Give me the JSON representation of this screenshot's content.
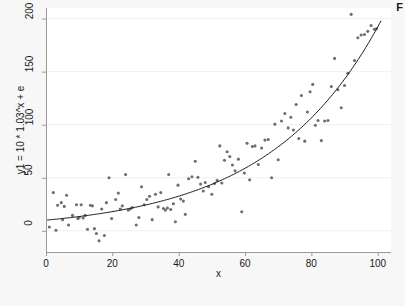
{
  "figure": {
    "corner_label": "F",
    "background_color": "#f7f7f7",
    "plot_background_color": "#ffffff"
  },
  "chart_data": {
    "type": "scatter",
    "title": "",
    "subtitle": "",
    "xlabel": "x",
    "ylabel": "y1 = 10 * 1.03^x + e",
    "xlim": [
      0,
      104
    ],
    "ylim": [
      -20,
      210
    ],
    "xticks": [
      0,
      20,
      40,
      60,
      80,
      100
    ],
    "yticks": [
      0,
      50,
      100,
      150,
      200
    ],
    "xtick_labels": [
      "0",
      "20",
      "40",
      "60",
      "80",
      "100"
    ],
    "ytick_labels": [
      "0",
      "50",
      "100",
      "150",
      "200"
    ],
    "grid": "horizontal-faint",
    "legend": "none",
    "marker_color": "#6e6e6e",
    "marker_size": 3.1,
    "line_color": "#1a1a1a",
    "line_width": 1.0,
    "fit": {
      "name": "exponential fit",
      "equation": "y = 10 * 1.03^x",
      "a": 10,
      "b": 1.03,
      "x_start": 0,
      "x_end": 101
    },
    "series": [
      {
        "name": "y1 observations",
        "points": [
          [
            1.0,
            3.5
          ],
          [
            2.2,
            36.0
          ],
          [
            3.0,
            0.5
          ],
          [
            3.5,
            24.0
          ],
          [
            4.6,
            26.5
          ],
          [
            5.0,
            10.5
          ],
          [
            5.5,
            23.0
          ],
          [
            6.2,
            33.5
          ],
          [
            6.8,
            5.5
          ],
          [
            8.0,
            14.5
          ],
          [
            9.2,
            24.5
          ],
          [
            9.6,
            11.5
          ],
          [
            10.0,
            12.5
          ],
          [
            10.6,
            24.5
          ],
          [
            11.2,
            12.0
          ],
          [
            11.8,
            14.5
          ],
          [
            12.5,
            1.5
          ],
          [
            13.4,
            24.0
          ],
          [
            14.0,
            23.5
          ],
          [
            14.6,
            2.0
          ],
          [
            15.2,
            -2.5
          ],
          [
            16.0,
            -9.5
          ],
          [
            16.8,
            20.5
          ],
          [
            17.6,
            -4.5
          ],
          [
            18.2,
            26.5
          ],
          [
            19.0,
            50.0
          ],
          [
            19.8,
            11.5
          ],
          [
            21.0,
            29.5
          ],
          [
            21.8,
            35.5
          ],
          [
            22.4,
            20.5
          ],
          [
            23.0,
            23.5
          ],
          [
            24.0,
            53.0
          ],
          [
            24.8,
            19.5
          ],
          [
            25.4,
            20.5
          ],
          [
            26.0,
            22.0
          ],
          [
            27.2,
            5.5
          ],
          [
            28.0,
            12.5
          ],
          [
            28.8,
            41.5
          ],
          [
            29.6,
            24.5
          ],
          [
            30.4,
            29.5
          ],
          [
            31.2,
            32.5
          ],
          [
            32.0,
            10.5
          ],
          [
            33.0,
            34.5
          ],
          [
            33.8,
            22.5
          ],
          [
            34.6,
            36.0
          ],
          [
            35.4,
            21.0
          ],
          [
            36.0,
            19.5
          ],
          [
            36.6,
            21.5
          ],
          [
            37.0,
            53.0
          ],
          [
            37.6,
            20.0
          ],
          [
            38.4,
            25.5
          ],
          [
            39.0,
            8.5
          ],
          [
            39.8,
            43.0
          ],
          [
            40.6,
            30.0
          ],
          [
            41.4,
            28.0
          ],
          [
            42.0,
            15.5
          ],
          [
            43.0,
            49.0
          ],
          [
            44.0,
            51.0
          ],
          [
            45.0,
            65.5
          ],
          [
            45.8,
            50.5
          ],
          [
            46.6,
            44.0
          ],
          [
            47.4,
            37.5
          ],
          [
            48.0,
            45.5
          ],
          [
            49.0,
            41.5
          ],
          [
            50.0,
            34.5
          ],
          [
            50.8,
            44.5
          ],
          [
            51.6,
            47.5
          ],
          [
            52.4,
            80.0
          ],
          [
            53.0,
            45.0
          ],
          [
            53.8,
            66.5
          ],
          [
            54.6,
            74.5
          ],
          [
            55.4,
            70.0
          ],
          [
            56.2,
            62.0
          ],
          [
            57.0,
            56.5
          ],
          [
            58.0,
            67.5
          ],
          [
            59.0,
            18.0
          ],
          [
            59.8,
            54.5
          ],
          [
            60.6,
            82.5
          ],
          [
            61.4,
            48.0
          ],
          [
            62.2,
            79.5
          ],
          [
            63.0,
            80.0
          ],
          [
            64.0,
            62.5
          ],
          [
            65.0,
            78.0
          ],
          [
            66.0,
            85.5
          ],
          [
            67.0,
            86.0
          ],
          [
            68.0,
            50.0
          ],
          [
            69.0,
            100.5
          ],
          [
            70.0,
            67.0
          ],
          [
            71.0,
            103.5
          ],
          [
            72.0,
            110.5
          ],
          [
            73.0,
            97.0
          ],
          [
            73.8,
            107.0
          ],
          [
            74.6,
            95.0
          ],
          [
            75.4,
            119.0
          ],
          [
            76.2,
            87.0
          ],
          [
            77.0,
            127.5
          ],
          [
            78.0,
            84.5
          ],
          [
            78.8,
            112.0
          ],
          [
            79.6,
            131.0
          ],
          [
            80.4,
            138.0
          ],
          [
            81.2,
            99.5
          ],
          [
            82.0,
            104.0
          ],
          [
            83.0,
            85.0
          ],
          [
            84.0,
            103.5
          ],
          [
            85.0,
            104.0
          ],
          [
            86.0,
            136.0
          ],
          [
            87.0,
            162.5
          ],
          [
            88.0,
            133.0
          ],
          [
            89.0,
            116.0
          ],
          [
            90.0,
            137.0
          ],
          [
            91.0,
            148.5
          ],
          [
            92.0,
            204.0
          ],
          [
            93.0,
            160.5
          ],
          [
            94.0,
            182.0
          ],
          [
            95.0,
            184.5
          ],
          [
            96.0,
            185.0
          ],
          [
            97.0,
            188.0
          ],
          [
            98.0,
            193.5
          ],
          [
            99.0,
            190.0
          ],
          [
            99.6,
            190.5
          ]
        ]
      }
    ]
  }
}
